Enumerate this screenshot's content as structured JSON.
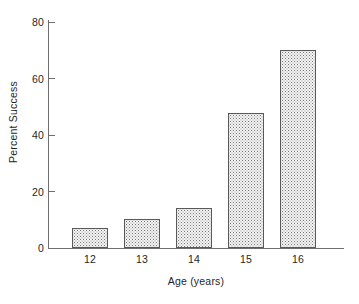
{
  "chart_data": {
    "type": "bar",
    "title": "",
    "xlabel": "Age (years)",
    "ylabel": "Percent Success",
    "categories": [
      "12",
      "13",
      "14",
      "15",
      "16"
    ],
    "values": [
      7,
      10,
      14,
      47,
      69
    ],
    "ylim": [
      0,
      80
    ],
    "yticks": [
      0,
      20,
      40,
      60,
      80
    ],
    "ytick_labels": [
      "0",
      "20",
      "40",
      "60",
      "80"
    ],
    "xtick_labels": [
      "12",
      "13",
      "14",
      "15",
      "16"
    ],
    "grid": false,
    "legend": null,
    "bar_fill": "#f0f0f0",
    "bar_edge": "#5a5a5a",
    "axis_color": "#6e6e6e",
    "background": "#ffffff",
    "bar_style": "stippled-gray"
  }
}
